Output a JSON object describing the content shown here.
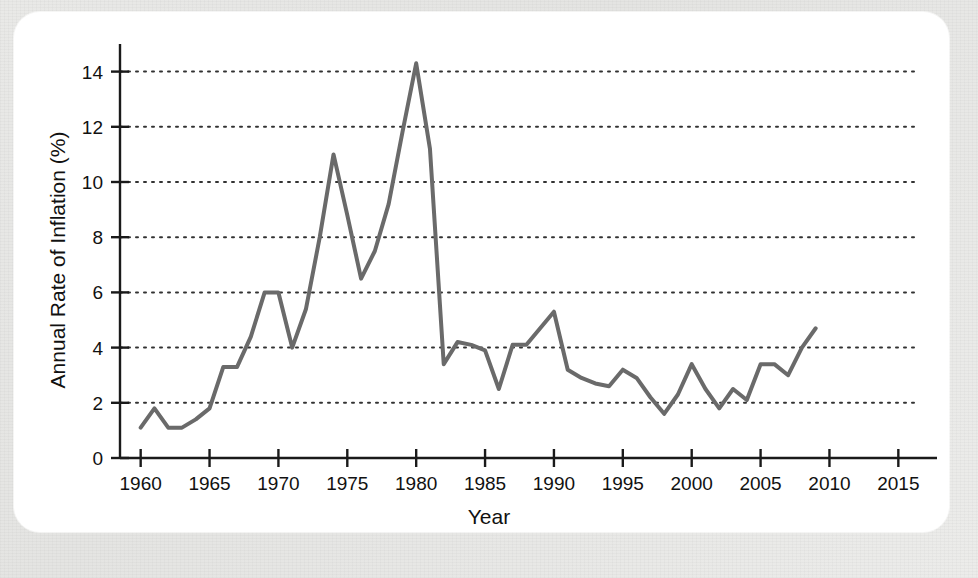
{
  "figure": {
    "background_color": "#e8e8e6",
    "panel_color": "#ffffff"
  },
  "chart_data": {
    "type": "line",
    "title": "",
    "xlabel": "Year",
    "ylabel": "Annual Rate of Inflation (%)",
    "xlim": [
      1958.5,
      2016.5
    ],
    "ylim": [
      0,
      15
    ],
    "xticks": [
      1960,
      1965,
      1970,
      1975,
      1980,
      1985,
      1990,
      1995,
      2000,
      2005,
      2010,
      2015
    ],
    "xticklabels": [
      "1960",
      "1965",
      "1970",
      "1975",
      "1980",
      "1985",
      "1990",
      "1995",
      "2000",
      "2005",
      "2010",
      "2015"
    ],
    "yticks": [
      0,
      2,
      4,
      6,
      8,
      10,
      12,
      14
    ],
    "yticklabels": [
      "0",
      "2",
      "4",
      "6",
      "8",
      "10",
      "12",
      "14"
    ],
    "grid": "horizontal-dotted",
    "legend": "none",
    "line_color": "#6a6a6a",
    "line_width": 4,
    "x": [
      1960,
      1961,
      1962,
      1963,
      1964,
      1965,
      1966,
      1967,
      1968,
      1969,
      1970,
      1971,
      1972,
      1973,
      1974,
      1975,
      1976,
      1977,
      1978,
      1979,
      1980,
      1981,
      1982,
      1983,
      1984,
      1985,
      1986,
      1987,
      1988,
      1989,
      1990,
      1991,
      1992,
      1993,
      1994,
      1995,
      1996,
      1997,
      1998,
      1999,
      2000,
      2001,
      2002,
      2003,
      2004,
      2005,
      2006,
      2007,
      2008,
      2009
    ],
    "values": [
      1.1,
      1.8,
      1.1,
      1.1,
      1.4,
      1.8,
      3.3,
      3.3,
      4.4,
      6.0,
      6.0,
      4.0,
      5.4,
      8.0,
      11.0,
      8.8,
      6.5,
      7.5,
      9.2,
      11.8,
      14.3,
      11.2,
      3.4,
      4.2,
      4.1,
      3.9,
      2.5,
      4.1,
      4.1,
      4.7,
      5.3,
      3.2,
      2.9,
      2.7,
      2.6,
      3.2,
      2.9,
      2.2,
      1.6,
      2.3,
      3.4,
      2.5,
      1.8,
      2.5,
      2.1,
      3.4,
      3.4,
      3.0,
      4.0,
      4.7
    ],
    "series_name": "Annual Rate of Inflation"
  }
}
